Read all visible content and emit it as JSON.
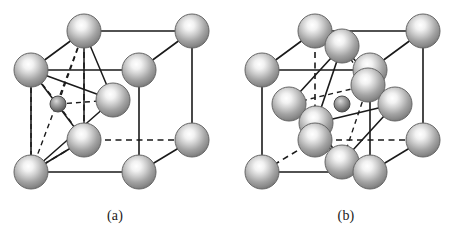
{
  "figure": {
    "background_color": "#ffffff",
    "line_color": "#1a1a1a",
    "sphere_colors": {
      "highlight": "#ffffff",
      "midtone": "#b4b4b4",
      "shadow": "#6e6e6e",
      "rim": "#5a5a5a",
      "small_highlight": "#d8d8d8",
      "small_shadow": "#4f4f4f"
    },
    "panels": [
      {
        "id": "a",
        "caption": "(a)",
        "description": "tetrahedral-interstitial-site",
        "cube": {
          "front_bottom_left": [
            31,
            172
          ],
          "front_bottom_right": [
            139,
            172
          ],
          "front_top_left": [
            31,
            70
          ],
          "front_top_right": [
            139,
            70
          ],
          "back_bottom_left": [
            84,
            140
          ],
          "back_bottom_right": [
            192,
            140
          ],
          "back_top_left": [
            84,
            31
          ],
          "back_top_right": [
            192,
            31
          ]
        },
        "large_sphere_radius": 17,
        "small_sphere_radius": 8,
        "interstitial_center": [
          58,
          104
        ],
        "coordinating_atoms": [
          [
            84,
            31
          ],
          [
            31,
            70
          ],
          [
            113,
            100
          ],
          [
            84,
            140
          ]
        ],
        "vertices": [
          {
            "name": "back-top-left",
            "x": 84,
            "y": 31,
            "hidden": false
          },
          {
            "name": "back-top-right",
            "x": 192,
            "y": 31,
            "hidden": false
          },
          {
            "name": "front-top-left",
            "x": 31,
            "y": 70,
            "hidden": false
          },
          {
            "name": "front-top-right",
            "x": 139,
            "y": 70,
            "hidden": false
          },
          {
            "name": "face-center-front",
            "x": 113,
            "y": 100,
            "hidden": false
          },
          {
            "name": "back-bottom-left",
            "x": 84,
            "y": 140,
            "hidden": false
          },
          {
            "name": "back-bottom-right",
            "x": 192,
            "y": 140,
            "hidden": false
          },
          {
            "name": "front-bottom-left",
            "x": 31,
            "y": 172,
            "hidden": false
          },
          {
            "name": "front-bottom-right",
            "x": 139,
            "y": 172,
            "hidden": false
          }
        ]
      },
      {
        "id": "b",
        "caption": "(b)",
        "description": "octahedral-interstitial-site",
        "cube": {
          "front_bottom_left": [
            31,
            172
          ],
          "front_bottom_right": [
            139,
            172
          ],
          "front_top_left": [
            31,
            70
          ],
          "front_top_right": [
            139,
            70
          ],
          "back_bottom_left": [
            84,
            140
          ],
          "back_bottom_right": [
            192,
            140
          ],
          "back_top_left": [
            84,
            31
          ],
          "back_top_right": [
            192,
            31
          ]
        },
        "large_sphere_radius": 17,
        "small_sphere_radius": 8,
        "interstitial_center": [
          111,
          104
        ],
        "octahedron_vertices": [
          [
            111,
            46
          ],
          [
            58,
            104
          ],
          [
            164,
            104
          ],
          [
            111,
            162
          ],
          [
            85,
            85
          ],
          [
            137,
            123
          ]
        ],
        "vertices": [
          {
            "name": "back-top-left",
            "x": 84,
            "y": 31,
            "hidden": false
          },
          {
            "name": "back-top-right",
            "x": 192,
            "y": 31,
            "hidden": false
          },
          {
            "name": "face-center-top",
            "x": 111,
            "y": 46,
            "hidden": false
          },
          {
            "name": "front-top-left",
            "x": 31,
            "y": 70,
            "hidden": false
          },
          {
            "name": "front-top-right",
            "x": 139,
            "y": 70,
            "hidden": false
          },
          {
            "name": "face-center-back",
            "x": 137,
            "y": 85,
            "hidden": false
          },
          {
            "name": "face-center-left",
            "x": 58,
            "y": 104,
            "hidden": false
          },
          {
            "name": "face-center-right",
            "x": 164,
            "y": 104,
            "hidden": false
          },
          {
            "name": "face-center-front",
            "x": 85,
            "y": 123,
            "hidden": false
          },
          {
            "name": "back-bottom-left",
            "x": 84,
            "y": 140,
            "hidden": false
          },
          {
            "name": "back-bottom-right",
            "x": 192,
            "y": 140,
            "hidden": false
          },
          {
            "name": "face-center-bottom",
            "x": 111,
            "y": 162,
            "hidden": false
          },
          {
            "name": "front-bottom-left",
            "x": 31,
            "y": 172,
            "hidden": false
          },
          {
            "name": "front-bottom-right",
            "x": 139,
            "y": 172,
            "hidden": false
          }
        ]
      }
    ]
  }
}
